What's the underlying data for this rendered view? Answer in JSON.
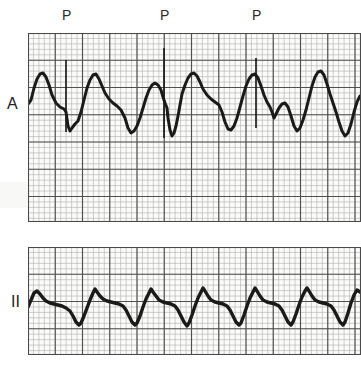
{
  "document": {
    "type": "ecg-rhythm-strip-figure",
    "background_color": "#ffffff",
    "width": 361,
    "height": 367
  },
  "annotations": {
    "pacing_markers": [
      {
        "label": "P",
        "x": 62,
        "y": 8
      },
      {
        "label": "P",
        "x": 160,
        "y": 8
      },
      {
        "label": "P",
        "x": 252,
        "y": 8
      }
    ]
  },
  "strips": [
    {
      "id": "strip-a",
      "lead_label": "A",
      "lead_label_pos": {
        "x": 7,
        "y": 96
      },
      "grid": {
        "x": 28,
        "y": 33,
        "width": 333,
        "height": 189,
        "small_mm": 5.45,
        "bold_every": 5,
        "small_color": "#9a9a9a",
        "bold_color": "#4a4a4a",
        "paper_color": "#fbfbf9"
      },
      "trace_color": "#1a1a1a",
      "trace_width": 3.0,
      "baseline_y": 108,
      "spikes": [
        {
          "x": 66,
          "top": 60,
          "bottom": 132
        },
        {
          "x": 164,
          "top": 48,
          "bottom": 138
        },
        {
          "x": 256,
          "top": 58,
          "bottom": 128
        }
      ],
      "trace_points": "28,104 31,100 34,88 37,79 40,74 43,73 46,77 49,85 52,95 56,103 60,107 64,109 66,112 68,126 70,131 72,128 75,124 78,121 81,112 84,100 87,88 90,80 93,75 96,74 99,79 102,86 105,93 109,99 113,103 117,106 121,110 125,118 128,128 131,133 134,131 137,126 140,118 143,108 146,98 149,90 152,85 155,83 158,85 161,90 163,97 165,103 167,108 168,118 170,130 172,136 174,133 176,126 178,116 180,105 182,94 185,85 188,78 191,74 194,73 197,76 200,82 203,89 207,95 211,99 215,102 219,105 222,112 225,122 228,129 231,130 234,126 237,118 240,107 243,96 246,86 249,79 252,75 255,74 258,78 261,86 264,95 267,102 270,107 272,112 274,118 276,114 279,108 282,104 285,103 288,107 291,116 294,126 297,131 300,128 303,120 306,110 309,98 312,86 315,77 318,72 321,71 324,75 327,84 330,94 333,103 336,112 339,122 342,131 345,136 348,133 351,124 354,112 357,102 360,96"
    },
    {
      "id": "strip-ii",
      "lead_label": "II",
      "lead_label_pos": {
        "x": 11,
        "y": 294
      },
      "grid": {
        "x": 28,
        "y": 247,
        "width": 333,
        "height": 108,
        "small_mm": 5.45,
        "bold_every": 5,
        "small_color": "#9a9a9a",
        "bold_color": "#4a4a4a",
        "paper_color": "#fbfbf9"
      },
      "trace_color": "#1a1a1a",
      "trace_width": 3.4,
      "baseline_y": 303,
      "trace_points": "28,307 31,300 34,293 37,291 40,294 43,298 46,301 50,303 54,304 58,305 62,306 66,308 70,311 73,316 76,322 79,325 81,323 84,316 87,308 90,300 93,293 95,289 97,292 100,296 103,299 107,301 111,302 115,303 119,304 123,306 126,310 129,316 132,322 135,325 137,323 140,316 143,307 146,299 149,293 151,289 153,292 156,296 159,300 163,302 167,303 171,304 175,306 178,310 181,316 184,322 187,326 189,323 192,315 195,306 198,298 201,292 203,288 205,291 208,296 211,300 215,302 219,303 223,304 227,306 230,310 233,316 236,322 239,325 241,323 244,315 247,306 250,298 253,292 255,288 257,291 260,296 263,300 267,302 271,303 275,304 279,306 282,310 285,316 288,322 291,325 293,322 296,314 299,305 302,297 305,291 307,288 309,291 312,296 315,300 319,302 323,303 327,304 331,306 334,310 337,316 340,322 343,325 345,322 348,313 351,303 354,295 357,290 360,292"
    }
  ]
}
